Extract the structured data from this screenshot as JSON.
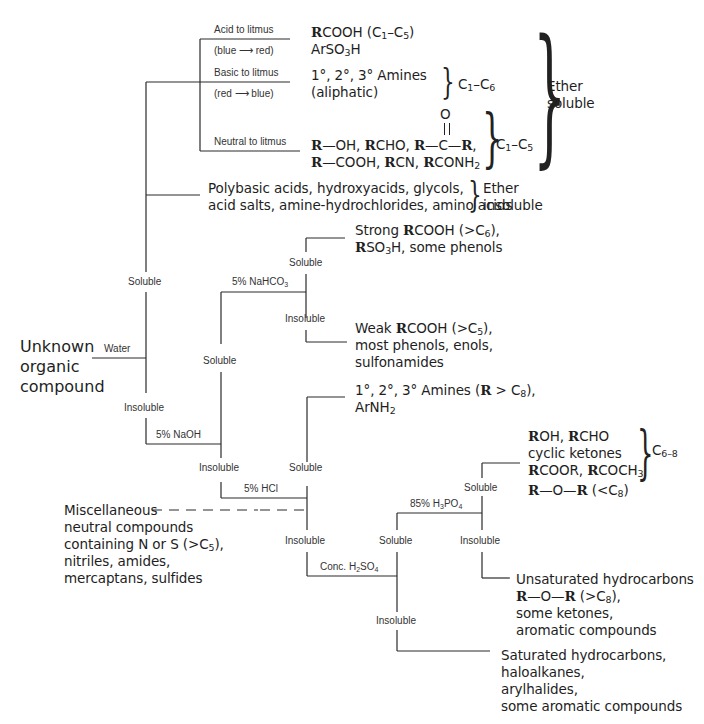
{
  "diagram": {
    "start_node": {
      "lines": [
        "Unknown",
        "organic",
        "compound"
      ]
    },
    "edges": {
      "water": "Water",
      "naoh": "5% NaOH",
      "nahco3": "5% NaHCO3",
      "hcl": "5% HCl",
      "h2so4": "Conc. H2SO4",
      "h3po4": "85% H3PO4"
    },
    "branch_labels": {
      "water_soluble": "Soluble",
      "water_insoluble": "Insoluble",
      "naoh_soluble": "Soluble",
      "naoh_insoluble": "Insoluble",
      "nahco3_soluble": "Soluble",
      "nahco3_insoluble": "Insoluble",
      "hcl_soluble": "Soluble",
      "hcl_insoluble": "Insoluble",
      "h2so4_soluble": "Soluble",
      "h2so4_insoluble": "Insoluble",
      "h3po4_soluble": "Soluble",
      "h3po4_insoluble": "Insoluble"
    },
    "litmus": {
      "acid": {
        "label": "Acid to litmus",
        "sub": "(blue ⟶ red)",
        "compounds": [
          "RCOOH (C1–C5)",
          "ArSO3H"
        ]
      },
      "basic": {
        "label": "Basic to litmus",
        "sub": "(red ⟶ blue)",
        "compounds": [
          "1°, 2°, 3° Amines",
          "(aliphatic)"
        ],
        "range": "C1–C6"
      },
      "neutral": {
        "label": "Neutral to litmus",
        "compounds": [
          "R—OH, RCHO, R—C(=O)—R,",
          "R—COOH, RCN, RCONH2"
        ],
        "carbonyl_o": "O",
        "range": "C1–C5"
      }
    },
    "ether_soluble": {
      "lines": [
        "Ether",
        "soluble"
      ]
    },
    "ether_insoluble": {
      "compounds": [
        "Polybasic acids, hydroxyacids, glycols,",
        "acid salts, amine-hydrochlorides, amino acids"
      ],
      "lines": [
        "Ether",
        "insoluble"
      ]
    },
    "results": {
      "strong_acids": [
        "Strong RCOOH (>C6),",
        "RSO3H, some phenols"
      ],
      "weak_acids": [
        "Weak RCOOH (>C5),",
        "most phenols, enols,",
        "sulfonamides"
      ],
      "amines": [
        "1°, 2°, 3° Amines (R > C8),",
        "ArNH2"
      ],
      "h3po4_soluble": [
        "ROH, RCHO",
        "cyclic ketones",
        "RCOOR, RCOCH3"
      ],
      "h3po4_soluble_range": "C6–8",
      "ethers_small": "R—O—R (<C8)",
      "unsaturated": [
        "Unsaturated hydrocarbons",
        "R—O—R (>C8),",
        "some ketones,",
        "aromatic compounds"
      ],
      "saturated": [
        "Saturated hydrocarbons,",
        "haloalkanes,",
        "arylhalides,",
        "some aromatic compounds"
      ],
      "miscellaneous": [
        "Miscellaneous",
        "neutral compounds",
        "containing N or S (>C5),",
        "nitriles, amides,",
        "mercaptans, sulfides"
      ]
    }
  }
}
